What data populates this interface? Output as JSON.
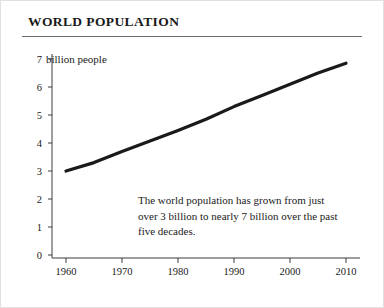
{
  "title": "WORLD POPULATION",
  "annotation": "The world population has grown from just over 3 billion to nearly 7 billion over the past five decades.",
  "axis_unit_note": "billion people",
  "y_ticks": [
    "7",
    "6",
    "5",
    "4",
    "3",
    "2",
    "1",
    "0"
  ],
  "x_ticks": [
    "1960",
    "1970",
    "1980",
    "1990",
    "2000",
    "2010"
  ],
  "colors": {
    "line": "#1a1a1a",
    "axis": "#3d3d3d",
    "text": "#1a1a1a",
    "background": "#ffffff"
  },
  "chart_data": {
    "type": "line",
    "title": "WORLD POPULATION",
    "xlabel": "",
    "ylabel": "billion people",
    "xlim": [
      1958,
      2012
    ],
    "ylim": [
      0,
      7
    ],
    "grid": false,
    "legend": false,
    "annotations": [
      {
        "text": "The world population has grown from just over 3 billion to nearly 7 billion over the past five decades.",
        "x": 1985,
        "y": 1.9
      }
    ],
    "x": [
      1960,
      1965,
      1970,
      1975,
      1980,
      1985,
      1990,
      1995,
      2000,
      2005,
      2010
    ],
    "series": [
      {
        "name": "World population",
        "values": [
          3.0,
          3.3,
          3.7,
          4.07,
          4.45,
          4.85,
          5.3,
          5.7,
          6.1,
          6.5,
          6.85
        ]
      }
    ]
  }
}
